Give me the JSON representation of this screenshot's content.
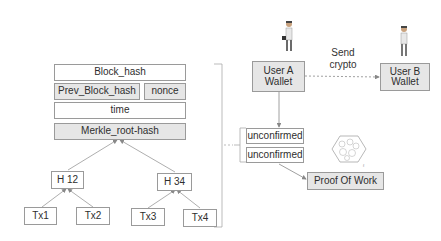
{
  "block_header": {
    "block_hash": "Block_hash",
    "prev_block_hash": "Prev_Block_hash",
    "nonce": "nonce",
    "time": "time",
    "merkle_root": "Merkle_root-hash"
  },
  "merkle_tree": {
    "h12": "H 12",
    "h34": "H 34",
    "tx1": "Tx1",
    "tx2": "Tx2",
    "tx3": "Tx3",
    "tx4": "Tx4"
  },
  "transaction_flow": {
    "user_a_wallet": "User A\nWallet",
    "user_b_wallet": "User B\nWallet",
    "send_crypto": "Send\ncrypto",
    "unconfirmed_1": "unconfirmed",
    "unconfirmed_2": "unconfirmed",
    "proof_of_work": "Proof Of Work"
  },
  "icons": {
    "user_a": "person-with-briefcase-icon",
    "user_b": "person-icon",
    "network": "hexagon-network-icon"
  },
  "colors": {
    "border": "#9a9a9a",
    "shaded_fill": "#e6e6e6",
    "text": "#2e2e2e"
  }
}
